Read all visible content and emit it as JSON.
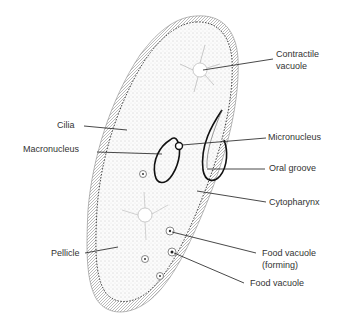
{
  "diagram": {
    "colors": {
      "ink": "#1a1a1a",
      "label_text": "#333333",
      "stipple": "#9a9a9a",
      "background": "#ffffff"
    },
    "labels": {
      "contractile_vacuole_l1": "Contractile",
      "contractile_vacuole_l2": "vacuole",
      "cilia": "Cilia",
      "micronucleus": "Micronucleus",
      "macronucleus": "Macronucleus",
      "oral_groove": "Oral groove",
      "cytopharynx": "Cytopharynx",
      "pellicle": "Pellicle",
      "food_vacuole_forming_l1": "Food vacuole",
      "food_vacuole_forming_l2": "(forming)",
      "food_vacuole": "Food vacuole"
    }
  }
}
